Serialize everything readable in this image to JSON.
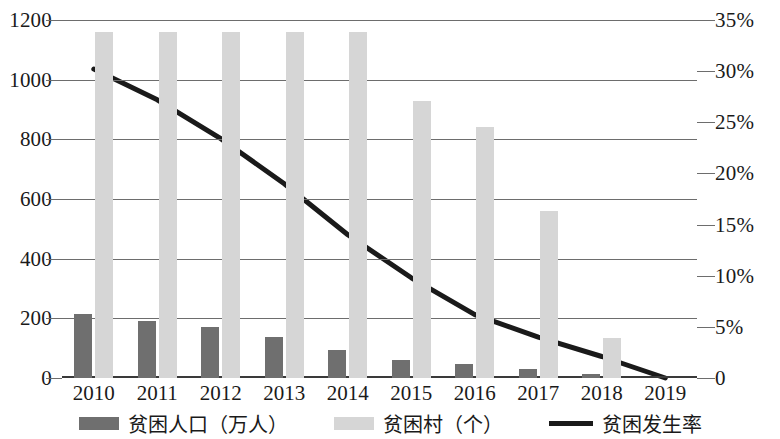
{
  "chart_data": {
    "type": "bar",
    "title": "",
    "xlabel": "",
    "ylabel": "",
    "grid": true,
    "legend_position": "bottom",
    "categories": [
      "2010",
      "2011",
      "2012",
      "2013",
      "2014",
      "2015",
      "2016",
      "2017",
      "2018",
      "2019"
    ],
    "axes": {
      "left": {
        "ticks": [
          "0",
          "200",
          "400",
          "600",
          "800",
          "1000",
          "1200"
        ],
        "values": [
          0,
          200,
          400,
          600,
          800,
          1000,
          1200
        ],
        "ylim": [
          0,
          1200
        ]
      },
      "right": {
        "ticks": [
          "0",
          "5%",
          "10%",
          "15%",
          "20%",
          "25%",
          "30%",
          "35%"
        ],
        "values": [
          0,
          5,
          10,
          15,
          20,
          25,
          30,
          35
        ],
        "ylim": [
          0,
          35
        ]
      }
    },
    "series": [
      {
        "name": "贫困人口（万人）",
        "type": "bar",
        "axis": "left",
        "color": "#6f6f6f",
        "values": [
          215,
          192,
          170,
          138,
          93,
          62,
          47,
          30,
          13,
          0
        ]
      },
      {
        "name": "贫困村（个）",
        "type": "bar",
        "axis": "left",
        "color": "#d6d6d6",
        "values": [
          1160,
          1160,
          1160,
          1160,
          1160,
          930,
          840,
          560,
          135,
          0
        ]
      },
      {
        "name": "贫困发生率",
        "type": "line",
        "axis": "right",
        "color": "#1a1a1a",
        "values": [
          30.2,
          27.2,
          23.4,
          19.0,
          14.0,
          9.8,
          6.2,
          4.0,
          2.1,
          0
        ]
      }
    ]
  },
  "legend": {
    "items": [
      {
        "label": "贫困人口（万人）",
        "marker": "dark-bar-swatch"
      },
      {
        "label": "贫困村（个）",
        "marker": "light-bar-swatch"
      },
      {
        "label": "贫困发生率",
        "marker": "line-swatch"
      }
    ]
  }
}
